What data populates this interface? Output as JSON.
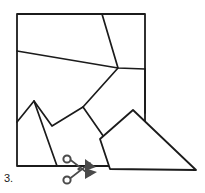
{
  "item": {
    "number_label": "3.",
    "caption": ""
  },
  "icons": {
    "scissors": "scissors-icon"
  },
  "colors": {
    "line": "#1b1b1b",
    "fill": "#ffffff",
    "scissors": "#4a4a4a",
    "background": "#ffffff"
  },
  "figure": {
    "name": "tangram-dissection-puzzle",
    "canvas": {
      "width": 205,
      "height": 193
    },
    "square": {
      "name": "main-square-piece",
      "points": "17,14 145,14 145,166 57,166 17,166"
    },
    "cut_lines": [
      {
        "name": "cut-line-steep-diagonal",
        "points": "102,14 118,68 83,107 52,126 34,101 17,122"
      },
      {
        "name": "cut-line-near-horizontal",
        "points": "17,51 118,68 145,69"
      },
      {
        "name": "cut-line-lower-left-wedge",
        "points": "34,101 57,166"
      },
      {
        "name": "cut-line-zigzag-right",
        "points": "83,107 106,140"
      },
      {
        "name": "cut-line-square-right-stub",
        "points": "145,69 145,113"
      }
    ],
    "detached_piece": {
      "name": "detached-pentagon-piece",
      "points": "133,110 100,139 110,169 196,170"
    }
  }
}
